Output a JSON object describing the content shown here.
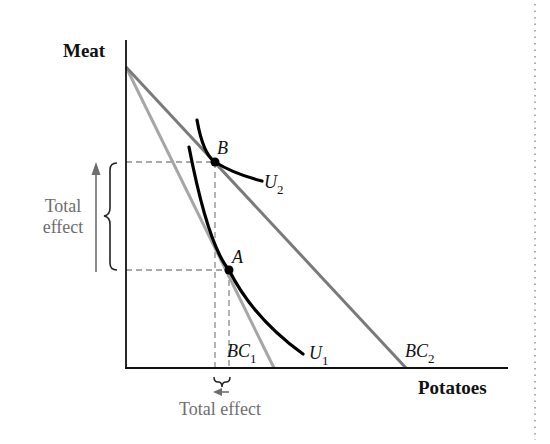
{
  "diagram": {
    "type": "economics-indifference-budget",
    "axes": {
      "y_label": "Meat",
      "x_label": "Potatoes"
    },
    "budget_constraints": [
      {
        "id": "BC1",
        "label": "BC",
        "sub": "1",
        "color": "#a6a6a6"
      },
      {
        "id": "BC2",
        "label": "BC",
        "sub": "2",
        "color": "#7a7a7a"
      }
    ],
    "indifference_curves": [
      {
        "id": "U1",
        "label": "U",
        "sub": "1"
      },
      {
        "id": "U2",
        "label": "U",
        "sub": "2"
      }
    ],
    "points": [
      {
        "id": "A",
        "label": "A"
      },
      {
        "id": "B",
        "label": "B"
      }
    ],
    "annotations": {
      "vertical_effect": {
        "line1": "Total",
        "line2": "effect"
      },
      "horizontal_effect": {
        "text": "Total effect"
      }
    },
    "colors": {
      "axis": "#111111",
      "curve": "#000000",
      "annotation": "#6e6e6e",
      "dashed": "#8c8c8c"
    }
  }
}
